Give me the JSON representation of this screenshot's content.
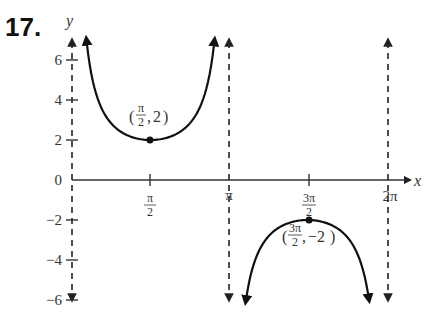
{
  "problem": {
    "number": "17."
  },
  "chart_data": {
    "type": "line",
    "title": "",
    "function": "y = 2csc(x)",
    "xlabel": "x",
    "ylabel": "y",
    "xlim": [
      0,
      6.6
    ],
    "ylim": [
      -6,
      6
    ],
    "x_ticks": [
      {
        "value": 1.5708,
        "label_num": "π",
        "label_den": "2"
      },
      {
        "value": 3.1416,
        "label": "π"
      },
      {
        "value": 4.7124,
        "label_num": "3π",
        "label_den": "2"
      },
      {
        "value": 6.2832,
        "label": "2π"
      }
    ],
    "y_ticks": [
      {
        "value": 6,
        "label": "6"
      },
      {
        "value": 4,
        "label": "4"
      },
      {
        "value": 2,
        "label": "2"
      },
      {
        "value": 0,
        "label": "0"
      },
      {
        "value": -2,
        "label": "−2"
      },
      {
        "value": -4,
        "label": "−4"
      },
      {
        "value": -6,
        "label": "−6"
      }
    ],
    "asymptotes": [
      0,
      3.1416,
      6.2832
    ],
    "key_points": [
      {
        "x": 1.5708,
        "y": 2,
        "label_x_num": "π",
        "label_x_den": "2",
        "label_y": "2",
        "type": "local minimum"
      },
      {
        "x": 4.7124,
        "y": -2,
        "label_x_num": "3π",
        "label_x_den": "2",
        "label_y": "−2",
        "type": "local maximum"
      }
    ],
    "series": [
      {
        "name": "branch-1",
        "x_range": [
          0.29,
          2.85
        ],
        "description": "upward U between 0 and π"
      },
      {
        "name": "branch-2",
        "x_range": [
          3.48,
          5.94
        ],
        "description": "downward ∩ between π and 2π"
      }
    ],
    "grid": false,
    "legend": null,
    "colors": {
      "curve": "#111111",
      "axis": "#333333"
    }
  }
}
